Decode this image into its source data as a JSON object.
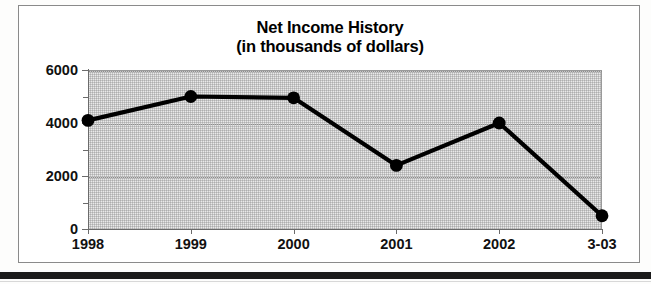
{
  "chart_data": {
    "type": "line",
    "title": "Net Income History",
    "subtitle": "(in thousands of dollars)",
    "xlabel": "",
    "ylabel": "",
    "categories": [
      "1998",
      "1999",
      "2000",
      "2001",
      "2002",
      "3-03"
    ],
    "values": [
      4100,
      5000,
      4950,
      2400,
      4000,
      500
    ],
    "ylim": [
      0,
      6000
    ],
    "y_ticks": [
      0,
      2000,
      4000,
      6000
    ],
    "y_tick_labels": [
      "0",
      "2000",
      "4000",
      "6000"
    ],
    "y_minor_ticks": [
      1000,
      3000,
      5000
    ],
    "grid": "horizontal-dotted",
    "legend": "none",
    "series_color": "#000000",
    "marker": "filled-circle",
    "plot_background": "#e9e9e9"
  },
  "figure": {
    "frame_border_color": "#8a8a8a",
    "axis_color": "#6b6b6b",
    "text_color": "#111111",
    "page_background": "#fdfdfc"
  }
}
